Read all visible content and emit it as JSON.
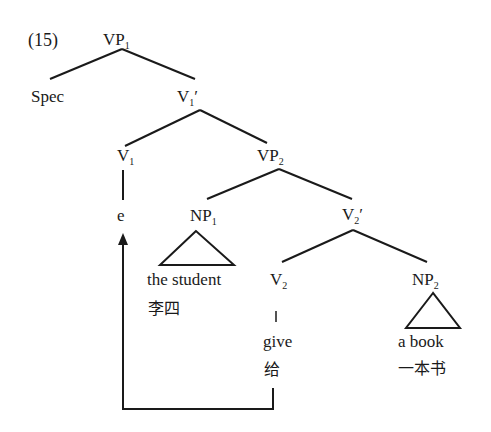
{
  "example_number": "(15)",
  "nodes": {
    "vp1": {
      "base": "VP",
      "sub": "1",
      "prime": ""
    },
    "spec": {
      "text": "Spec"
    },
    "v1bar": {
      "base": "V",
      "sub": "1",
      "prime": "′"
    },
    "v1": {
      "base": "V",
      "sub": "1"
    },
    "vp2": {
      "base": "VP",
      "sub": "2"
    },
    "e": {
      "text": "e"
    },
    "np1": {
      "base": "NP",
      "sub": "1"
    },
    "v2bar": {
      "base": "V",
      "sub": "2",
      "prime": "′"
    },
    "v2": {
      "base": "V",
      "sub": "2"
    },
    "np2": {
      "base": "NP",
      "sub": "2"
    }
  },
  "leaves": {
    "np1_en": "the student",
    "np1_zh": "李四",
    "v2_en": "give",
    "v2_zh": "给",
    "np2_en": "a book",
    "np2_zh": "一本书"
  },
  "colors": {
    "line": "#1a1a1a",
    "background": "#ffffff"
  }
}
